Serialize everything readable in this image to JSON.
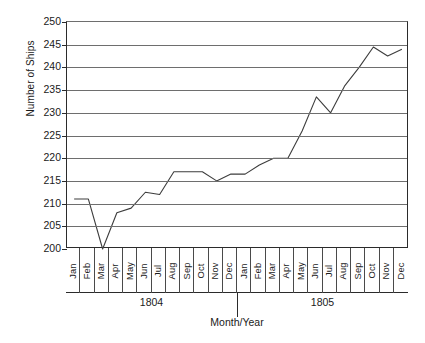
{
  "chart_data": {
    "type": "line",
    "title": "",
    "xlabel": "Month/Year",
    "ylabel": "Number of Ships",
    "ylim": [
      200,
      250
    ],
    "yticks": [
      200,
      205,
      210,
      215,
      220,
      225,
      230,
      235,
      240,
      245,
      250
    ],
    "grid": true,
    "legend": "none",
    "months": [
      "Jan",
      "Feb",
      "Mar",
      "Apr",
      "May",
      "Jun",
      "Jul",
      "Aug",
      "Sep",
      "Oct",
      "Nov",
      "Dec"
    ],
    "groups": [
      {
        "year": "1804",
        "months": [
          "Jan",
          "Feb",
          "Mar",
          "Apr",
          "May",
          "Jun",
          "Jul",
          "Aug",
          "Sep",
          "Oct",
          "Nov",
          "Dec"
        ]
      },
      {
        "year": "1805",
        "months": [
          "Jan",
          "Feb",
          "Mar",
          "Apr",
          "May",
          "Jun",
          "Jul",
          "Aug",
          "Sep",
          "Oct",
          "Nov",
          "Dec"
        ]
      }
    ],
    "categories": [
      "Jan 1804",
      "Feb 1804",
      "Mar 1804",
      "Apr 1804",
      "May 1804",
      "Jun 1804",
      "Jul 1804",
      "Aug 1804",
      "Sep 1804",
      "Oct 1804",
      "Nov 1804",
      "Dec 1804",
      "Jan 1805",
      "Feb 1805",
      "Mar 1805",
      "Apr 1805",
      "May 1805",
      "Jun 1805",
      "Jul 1805",
      "Aug 1805",
      "Sep 1805",
      "Oct 1805",
      "Nov 1805",
      "Dec 1805"
    ],
    "values": [
      211,
      211,
      200,
      208,
      209,
      212.5,
      212,
      217,
      217,
      217,
      215,
      216.5,
      216.5,
      218.5,
      220,
      220,
      226,
      233.5,
      230,
      236,
      240,
      244.5,
      242.5,
      244
    ],
    "line_color": "#3d3d3d",
    "grid_color": "#6e6e6e",
    "axis_color": "#2b2b2b"
  }
}
